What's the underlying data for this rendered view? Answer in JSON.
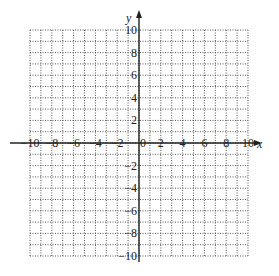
{
  "chart_data": {
    "type": "grid",
    "title": "",
    "xlabel": "x",
    "ylabel": "y",
    "xlim": [
      -10,
      10
    ],
    "ylim": [
      -10,
      10
    ],
    "grid": true,
    "grid_step": 1,
    "grid_style": "dotted",
    "x_tick_labels": [
      "-10",
      "-8",
      "-6",
      "-4",
      "-2",
      "0",
      "2",
      "4",
      "6",
      "8",
      "10"
    ],
    "y_tick_labels": [
      "10",
      "8",
      "6",
      "4",
      "2",
      "-2",
      "-4",
      "-6",
      "-8",
      "-10"
    ],
    "series": []
  },
  "colors": {
    "grid": "#555555",
    "axis": "#222222",
    "background": "#ffffff"
  }
}
